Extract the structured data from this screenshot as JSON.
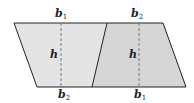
{
  "diagram": {
    "colors": {
      "left_fill": "#e4e4e4",
      "right_fill": "#d6d6d6",
      "stroke": "#222222",
      "dash": "#777777",
      "background": "#ffffff"
    },
    "left_trapezoid": {
      "top_label": {
        "base": "b",
        "sub": "1"
      },
      "bottom_label": {
        "base": "b",
        "sub": "2"
      },
      "height_label": "h"
    },
    "right_trapezoid": {
      "top_label": {
        "base": "b",
        "sub": "2"
      },
      "bottom_label": {
        "base": "b",
        "sub": "1"
      },
      "height_label": "h"
    }
  }
}
